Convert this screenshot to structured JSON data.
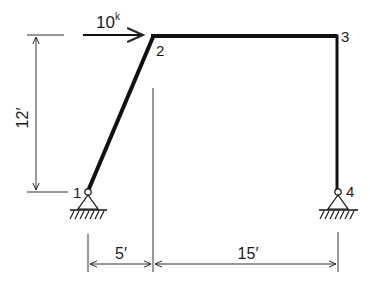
{
  "diagram": {
    "type": "structural-frame",
    "colors": {
      "ink": "#111111",
      "dim": "#333333",
      "background": "#ffffff"
    },
    "nodes": [
      {
        "id": "1",
        "label": "1",
        "support": "pin"
      },
      {
        "id": "2",
        "label": "2",
        "support": "none"
      },
      {
        "id": "3",
        "label": "3",
        "support": "none"
      },
      {
        "id": "4",
        "label": "4",
        "support": "pin"
      }
    ],
    "members": [
      {
        "from": "1",
        "to": "2"
      },
      {
        "from": "2",
        "to": "3"
      },
      {
        "from": "3",
        "to": "4"
      }
    ],
    "load": {
      "value": "10",
      "unit": "k",
      "direction": "right",
      "at_node": "2"
    },
    "dimensions": {
      "height": "12′",
      "left_span": "5′",
      "right_span": "15′"
    }
  }
}
